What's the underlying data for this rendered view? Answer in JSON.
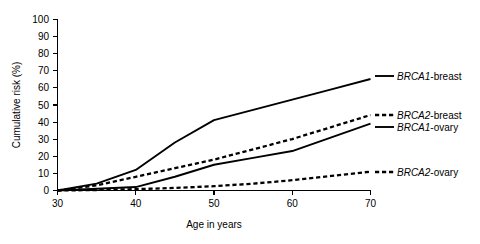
{
  "chart_data": {
    "type": "line",
    "title": "",
    "xlabel": "Age in years",
    "ylabel": "Cumulative risk (%)",
    "xlim": [
      30,
      70
    ],
    "ylim": [
      0,
      100
    ],
    "xticks": [
      30,
      40,
      50,
      60,
      70
    ],
    "yticks": [
      0,
      10,
      20,
      30,
      40,
      50,
      60,
      70,
      80,
      90,
      100
    ],
    "xtick_labels": [
      "30",
      "40",
      "50",
      "60",
      "70"
    ],
    "ytick_labels": [
      "0",
      "10",
      "20",
      "30",
      "40",
      "50",
      "60",
      "70",
      "80",
      "90",
      "100"
    ],
    "grid": false,
    "legend_position": "right-inline",
    "x": [
      30,
      35,
      40,
      45,
      50,
      55,
      60,
      65,
      70
    ],
    "series": [
      {
        "name": "BRCA1-breast",
        "gene": "BRCA1",
        "cancer": "breast",
        "style": "solid",
        "color": "#000000",
        "values": [
          0,
          4,
          12,
          28,
          41,
          47,
          53,
          59,
          65
        ]
      },
      {
        "name": "BRCA2-breast",
        "gene": "BRCA2",
        "cancer": "breast",
        "style": "dashed",
        "color": "#000000",
        "values": [
          0,
          3,
          8,
          13,
          18,
          24,
          30,
          37,
          44
        ]
      },
      {
        "name": "BRCA1-ovary",
        "gene": "BRCA1",
        "cancer": "ovary",
        "style": "solid",
        "color": "#000000",
        "values": [
          0,
          1,
          2,
          8,
          15,
          19,
          23,
          31,
          39
        ]
      },
      {
        "name": "BRCA2-ovary",
        "gene": "BRCA2",
        "cancer": "ovary",
        "style": "dashed",
        "color": "#000000",
        "values": [
          0,
          0.3,
          0.8,
          1.5,
          2.5,
          4,
          6,
          8.5,
          11
        ]
      }
    ]
  },
  "axes": {
    "y_title": "Cumulative risk (%)",
    "x_title": "Age in years",
    "y_ticks": [
      "100",
      "90",
      "80",
      "70",
      "60",
      "50",
      "40",
      "30",
      "20",
      "10",
      "0"
    ],
    "x_ticks": [
      "30",
      "40",
      "50",
      "60",
      "70"
    ]
  },
  "legend": {
    "entries": [
      {
        "gene": "BRCA1",
        "separator": "-",
        "cancer": "breast",
        "style": "solid"
      },
      {
        "gene": "BRCA2",
        "separator": "-",
        "cancer": "breast",
        "style": "dashed"
      },
      {
        "gene": "BRCA1",
        "separator": "-",
        "cancer": "ovary",
        "style": "solid"
      },
      {
        "gene": "BRCA2",
        "separator": "-",
        "cancer": "ovary",
        "style": "dashed"
      }
    ],
    "labels": [
      "BRCA1-breast",
      "BRCA2-breast",
      "BRCA1-ovary",
      "BRCA2-ovary"
    ]
  },
  "colors": {
    "background": "#ffffff",
    "ink": "#000000"
  }
}
